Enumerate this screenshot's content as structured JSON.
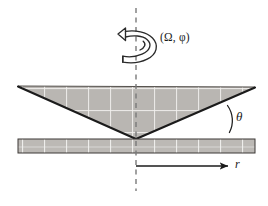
{
  "figure": {
    "background_color": "#ffffff",
    "stroke_color": "#1b1b1b",
    "fill_color": "#b9b6b2",
    "grid_line_color": "#ffffff",
    "dashed_axis_color": "#6e6e6e"
  },
  "labels": {
    "rotation_label": "(Ω, φ)",
    "angle_label": "θ",
    "radial_label": "r"
  },
  "icons": {
    "rotation_arrow": "curved-rotation-arrow-icon",
    "radial_arrow": "right-arrow-icon",
    "angle_arc": "arc-icon",
    "rotation_axis": "dashed-vertical-axis-icon"
  },
  "geometry": {
    "cone": {
      "name": "inverted-cone",
      "left_vertex": [
        18,
        86
      ],
      "right_vertex": [
        255,
        87
      ],
      "apex": [
        136,
        139
      ]
    },
    "plate": {
      "name": "stationary-plate",
      "x": 18,
      "y": 139,
      "width": 237,
      "height": 14
    },
    "axis": {
      "x": 136,
      "y_top": 8,
      "y_bottom": 191
    },
    "radial_arrow": {
      "x_start": 136,
      "x_end": 228,
      "y": 166
    }
  }
}
